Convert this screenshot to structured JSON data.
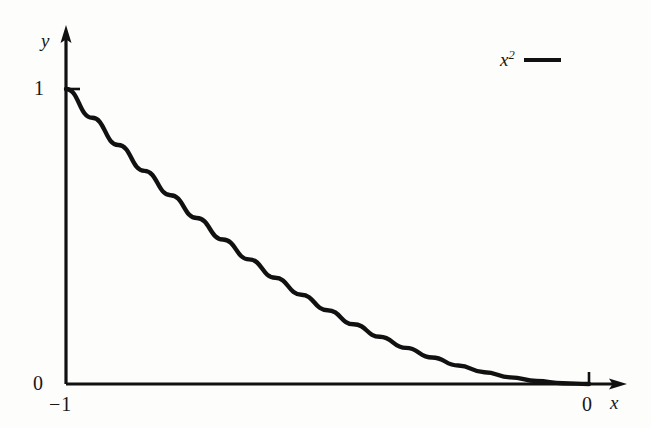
{
  "chart_data": {
    "type": "line",
    "title": "",
    "xlabel": "x",
    "ylabel": "y",
    "xlim": [
      -1,
      0
    ],
    "ylim": [
      0,
      1
    ],
    "grid": false,
    "legend_position": "top-right",
    "x_ticks": [
      {
        "value": -1,
        "label": "−1"
      },
      {
        "value": 0,
        "label": "0"
      }
    ],
    "y_ticks": [
      {
        "value": 0,
        "label": "0"
      },
      {
        "value": 1,
        "label": "1"
      }
    ],
    "series": [
      {
        "name": "x²",
        "name_base": "x",
        "name_exponent": "2",
        "color": "#111111",
        "x": [
          -1.0,
          -0.95,
          -0.9,
          -0.85,
          -0.8,
          -0.75,
          -0.7,
          -0.65,
          -0.6,
          -0.55,
          -0.5,
          -0.45,
          -0.4,
          -0.35,
          -0.3,
          -0.25,
          -0.2,
          -0.15,
          -0.1,
          -0.05,
          0.0
        ],
        "values": [
          1.0,
          0.9025,
          0.81,
          0.7225,
          0.64,
          0.5625,
          0.49,
          0.4225,
          0.36,
          0.3025,
          0.25,
          0.2025,
          0.16,
          0.1225,
          0.09,
          0.0625,
          0.04,
          0.0225,
          0.01,
          0.0025,
          0.0
        ]
      }
    ],
    "annotations": []
  },
  "axes": {
    "y_axis_label": "y",
    "x_axis_label": "x",
    "y_tick_1": "1",
    "y_tick_0": "0",
    "x_tick_neg1": "−1",
    "x_tick_0": "0"
  },
  "legend": {
    "entry_label_base": "x",
    "entry_label_exponent": "2",
    "entry_color": "#111111"
  },
  "style": {
    "background": "#fdfdfc",
    "ink": "#111111"
  }
}
